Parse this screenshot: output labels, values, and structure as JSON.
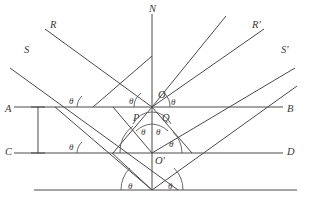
{
  "figure": {
    "stroke_color": "#4a4a4a",
    "background": "#ffffff",
    "width": 309,
    "height": 202,
    "angle_symbol": "θ",
    "point_labels": [
      {
        "id": "N",
        "text": "N",
        "x": 149,
        "y": 4
      },
      {
        "id": "R",
        "text": "R",
        "x": 50,
        "y": 20
      },
      {
        "id": "Rp",
        "text": "R'",
        "x": 252,
        "y": 20
      },
      {
        "id": "S",
        "text": "S",
        "x": 24,
        "y": 45
      },
      {
        "id": "Sp",
        "text": "S'",
        "x": 281,
        "y": 45
      },
      {
        "id": "O",
        "text": "O",
        "x": 158,
        "y": 90
      },
      {
        "id": "A",
        "text": "A",
        "x": 5,
        "y": 104
      },
      {
        "id": "B",
        "text": "B",
        "x": 287,
        "y": 104
      },
      {
        "id": "P",
        "text": "P",
        "x": 133,
        "y": 113
      },
      {
        "id": "Q",
        "text": "Q",
        "x": 162,
        "y": 113
      },
      {
        "id": "C",
        "text": "C",
        "x": 5,
        "y": 147
      },
      {
        "id": "D",
        "text": "D",
        "x": 287,
        "y": 147
      },
      {
        "id": "Op",
        "text": "O'",
        "x": 155,
        "y": 156
      }
    ],
    "angle_labels": [
      {
        "id": "t1",
        "x": 69,
        "y": 97
      },
      {
        "id": "t2",
        "x": 129,
        "y": 97
      },
      {
        "id": "t3",
        "x": 171,
        "y": 98
      },
      {
        "id": "t4",
        "x": 141,
        "y": 128
      },
      {
        "id": "t5",
        "x": 156,
        "y": 128
      },
      {
        "id": "t6",
        "x": 69,
        "y": 143
      },
      {
        "id": "t7",
        "x": 169,
        "y": 140
      },
      {
        "id": "t8",
        "x": 128,
        "y": 182
      },
      {
        "id": "t9",
        "x": 168,
        "y": 182
      }
    ],
    "geometry": {
      "vertex_O": {
        "x": 152,
        "y": 107
      },
      "vertex_Op": {
        "x": 152,
        "y": 153
      },
      "vertex_bottom": {
        "x": 152,
        "y": 190
      },
      "line_AB_y": 107,
      "line_CD_y": 153,
      "line_bottom_y": 190,
      "normal_top_y": 14,
      "bracket_x": 38
    }
  }
}
